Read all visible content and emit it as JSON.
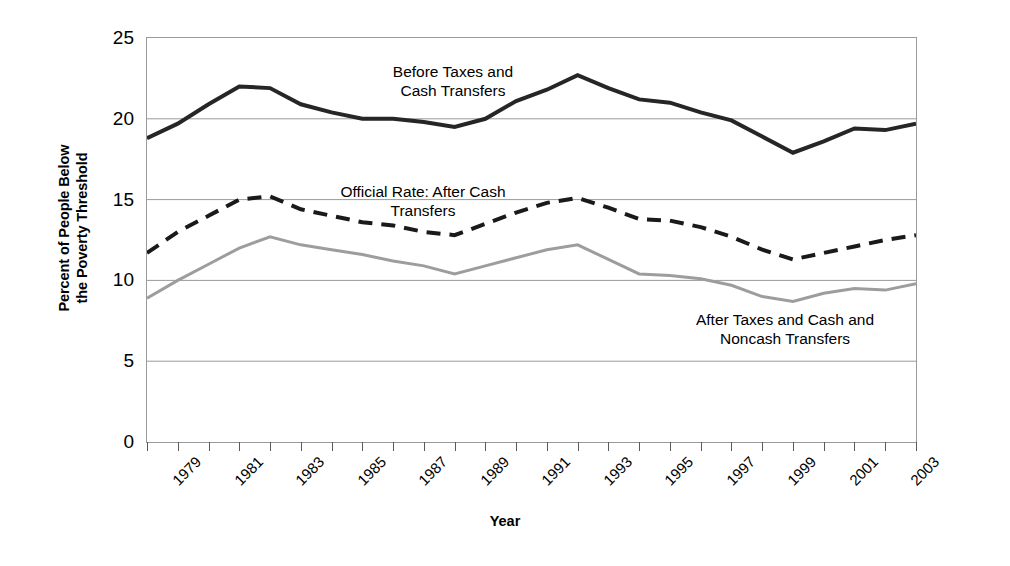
{
  "chart_data": {
    "type": "line",
    "title": "",
    "xlabel": "Year",
    "ylabel": "Percent of People Below the Poverty Threshold",
    "ylabel_line1": "Percent of People Below",
    "ylabel_line2": "the Poverty Threshold",
    "xlim": [
      1979,
      2004
    ],
    "ylim": [
      0,
      25
    ],
    "yticks": [
      0,
      5,
      10,
      15,
      20,
      25
    ],
    "ytick_labels": [
      "0",
      "5",
      "10",
      "15",
      "20",
      "25"
    ],
    "x": [
      1979,
      1980,
      1981,
      1982,
      1983,
      1984,
      1985,
      1986,
      1987,
      1988,
      1989,
      1990,
      1991,
      1992,
      1993,
      1994,
      1995,
      1996,
      1997,
      1998,
      1999,
      2000,
      2001,
      2002,
      2003,
      2004
    ],
    "xtick_labels": [
      "1979",
      "",
      "1981",
      "",
      "1983",
      "",
      "1985",
      "",
      "1987",
      "",
      "1989",
      "",
      "1991",
      "",
      "1993",
      "",
      "1995",
      "",
      "1997",
      "",
      "1999",
      "",
      "2001",
      "",
      "2003",
      ""
    ],
    "grid": "horizontal",
    "legend_position": "inline-annotations",
    "series": [
      {
        "name": "Before Taxes and Cash Transfers",
        "style": "solid",
        "color": "#262626",
        "width": 4,
        "values": [
          18.8,
          19.7,
          20.9,
          22.0,
          21.9,
          20.9,
          20.4,
          20.0,
          20.0,
          19.8,
          19.5,
          20.0,
          21.1,
          21.8,
          22.7,
          21.9,
          21.2,
          21.0,
          20.4,
          19.9,
          18.9,
          17.9,
          18.6,
          19.4,
          19.3,
          19.7
        ]
      },
      {
        "name": "Official Rate: After Cash Transfers",
        "style": "dashed",
        "color": "#1a1a1a",
        "width": 4,
        "values": [
          11.7,
          13.0,
          14.0,
          15.0,
          15.2,
          14.4,
          14.0,
          13.6,
          13.4,
          13.0,
          12.8,
          13.5,
          14.2,
          14.8,
          15.1,
          14.5,
          13.8,
          13.7,
          13.3,
          12.7,
          11.9,
          11.3,
          11.7,
          12.1,
          12.5,
          12.8
        ]
      },
      {
        "name": "After Taxes and Cash and Noncash Transfers",
        "style": "solid",
        "color": "#9d9d9d",
        "width": 3,
        "values": [
          8.9,
          10.0,
          11.0,
          12.0,
          12.7,
          12.2,
          11.9,
          11.6,
          11.2,
          10.9,
          10.4,
          10.9,
          11.4,
          11.9,
          12.2,
          11.3,
          10.4,
          10.3,
          10.1,
          9.7,
          9.0,
          8.7,
          9.2,
          9.5,
          9.4,
          9.8
        ]
      }
    ],
    "annotations": [
      {
        "id": "before-taxes",
        "line1": "Before Taxes and",
        "line2": "Cash Transfers"
      },
      {
        "id": "official-rate",
        "line1": "Official Rate: After Cash",
        "line2": "Transfers"
      },
      {
        "id": "after-taxes",
        "line1": "After Taxes and Cash and",
        "line2": "Noncash Transfers"
      }
    ]
  }
}
